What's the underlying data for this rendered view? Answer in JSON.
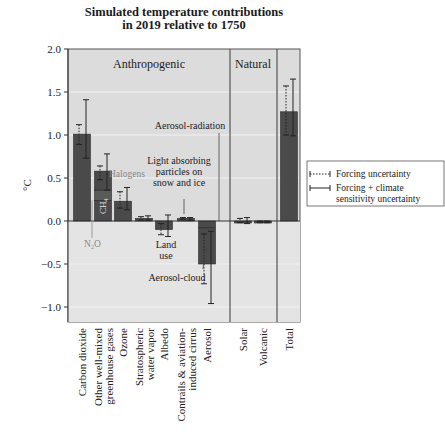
{
  "chart_data": {
    "type": "bar",
    "title_lines": [
      "Simulated temperature contributions",
      "in 2019 relative to 1750"
    ],
    "ylabel": "°C",
    "xlabel": "",
    "ylim": [
      -1.2,
      2.0
    ],
    "yticks": [
      2.0,
      1.5,
      1.0,
      0.5,
      0.0,
      -0.5,
      -1.0
    ],
    "ytick_labels": [
      "2.0",
      "1.5",
      "1.0",
      "0.5",
      "0.0",
      "−0.5",
      "−1.0"
    ],
    "grid": true,
    "sections": [
      {
        "label": "Anthropogenic",
        "categories": 7
      },
      {
        "label": "Natural",
        "categories": 2
      },
      {
        "label": "",
        "categories": 1
      }
    ],
    "categories": [
      [
        "Carbon dioxide"
      ],
      [
        "Other well-mixed",
        "greenhouse gases"
      ],
      [
        "Ozone"
      ],
      [
        "Stratospheric",
        "water vapor"
      ],
      [
        "Albedo"
      ],
      [
        "Contrails & aviation-",
        "induced cirrus"
      ],
      [
        "Aerosol"
      ],
      [
        "Solar"
      ],
      [
        "Volcanic"
      ],
      [
        "Total"
      ]
    ],
    "values": [
      1.01,
      0.58,
      0.23,
      0.03,
      -0.1,
      0.03,
      -0.5,
      0.0,
      -0.01,
      1.27
    ],
    "forcing_uncertainty": [
      [
        0.89,
        1.12
      ],
      [
        0.48,
        0.64
      ],
      [
        0.15,
        0.34
      ],
      [
        0.01,
        0.05
      ],
      [
        -0.16,
        -0.03
      ],
      [
        0.02,
        0.04
      ],
      [
        -0.73,
        -0.15
      ],
      [
        -0.02,
        0.03
      ],
      [
        -0.02,
        0.0
      ],
      [
        1.0,
        1.57
      ]
    ],
    "forcing_climate_uncertainty": [
      [
        0.73,
        1.41
      ],
      [
        0.36,
        0.78
      ],
      [
        0.13,
        0.39
      ],
      [
        0.01,
        0.06
      ],
      [
        -0.18,
        0.07
      ],
      [
        0.01,
        0.04
      ],
      [
        -0.96,
        -0.12
      ],
      [
        -0.03,
        0.04
      ],
      [
        -0.02,
        0.0
      ],
      [
        0.99,
        1.65
      ]
    ],
    "stacked_components": {
      "Other well-mixed greenhouse gases": [
        {
          "name": "N2O",
          "from": 0.0,
          "to": 0.24
        },
        {
          "name": "CH4",
          "from": 0.24,
          "to": 0.36
        },
        {
          "name": "Halogens",
          "from": 0.36,
          "to": 0.58
        }
      ],
      "Aerosol": [
        {
          "name": "Aerosol-radiation",
          "from": 0.0,
          "to": -0.08
        },
        {
          "name": "Aerosol-cloud",
          "from": -0.08,
          "to": -0.5
        }
      ]
    },
    "annotations": [
      "Halogens",
      "CH4",
      "N2O",
      "Light absorbing particles on snow and ice",
      "Land use",
      "Aerosol-radiation",
      "Aerosol-cloud"
    ],
    "legend": {
      "position": "right",
      "entries": [
        {
          "style": "dotted",
          "label": [
            "Forcing uncertainty"
          ]
        },
        {
          "style": "solid",
          "label": [
            "Forcing + climate",
            "sensitivity uncertainty"
          ]
        }
      ]
    },
    "colors": {
      "bar": "#4a4a4a",
      "bar_light": "#6a6a6a",
      "background": "#dcdcdc",
      "grid": "#f2f2f2"
    }
  },
  "labels": {
    "ch4": "CH",
    "ch4_sub": "4",
    "n2o_n": "N",
    "n2o_sub": "2",
    "n2o_o": "O",
    "halogens": "Halogens",
    "lap": [
      "Light absorbing",
      "particles on",
      "snow and ice"
    ],
    "land_use": [
      "Land",
      "use"
    ],
    "aerosol_radiation": "Aerosol-radiation",
    "aerosol_cloud": "Aerosol-cloud"
  }
}
